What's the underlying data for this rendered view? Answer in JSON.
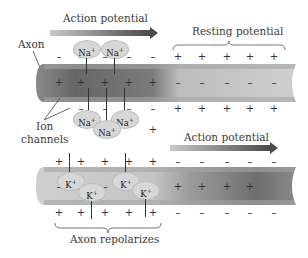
{
  "labels": {
    "action_potential_top": "Action potential",
    "resting_potential": "Resting potential",
    "axon": "Axon",
    "ion_channels_1": "Ion",
    "ion_channels_2": "channels",
    "action_potential_bottom": "Action potential",
    "axon_repolarizes": "Axon repolarizes"
  },
  "ions": {
    "sodium": "Na",
    "potassium": "K",
    "charge": "+"
  },
  "signs": {
    "plus": "+",
    "minus": "–"
  },
  "colors": {
    "axon_dark": "#6e6e6e",
    "axon_light": "#c9c9c9",
    "arrow_dark": "#555555",
    "ion_bubble": "#d7d7d7"
  }
}
